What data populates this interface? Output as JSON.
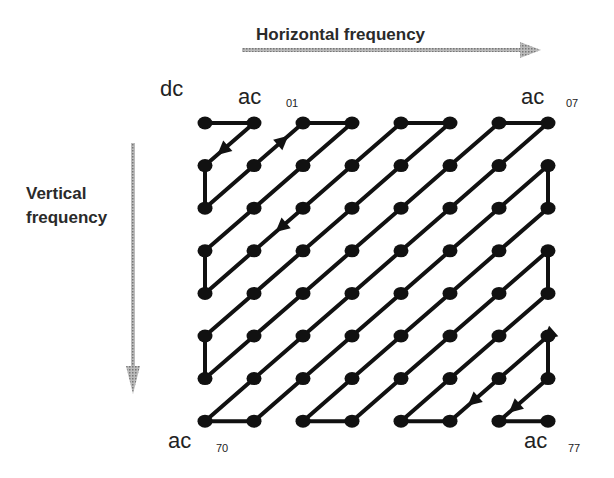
{
  "labels": {
    "horizontal": "Horizontal frequency",
    "vertical_line1": "Vertical",
    "vertical_line2": "frequency",
    "dc": "dc",
    "ac": "ac",
    "sub_01": "01",
    "sub_07": "07",
    "sub_70": "70",
    "sub_77": "77"
  },
  "grid": {
    "rows": 8,
    "cols": 8,
    "x0": 205,
    "y0": 123,
    "dx": 49,
    "dy": 42.6,
    "scan_order": "zigzag"
  },
  "colors": {
    "line": "#111111",
    "axis_arrow": "#999999"
  }
}
